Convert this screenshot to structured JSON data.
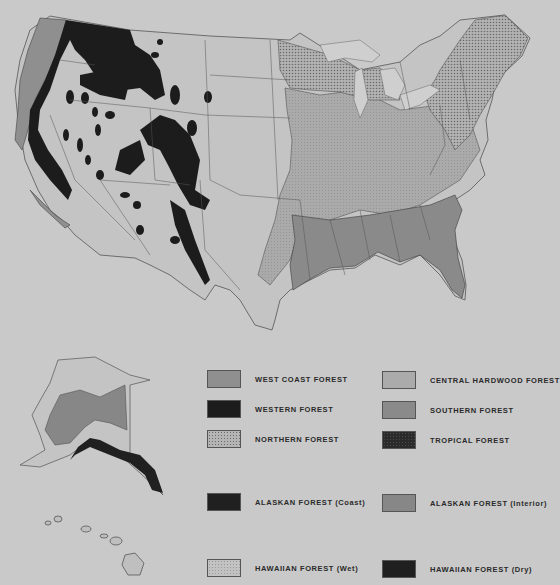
{
  "map": {
    "title": "Forest Regions of the United States",
    "regions_shown": [
      "Contiguous United States",
      "Alaska",
      "Hawaii"
    ],
    "colors": {
      "background": "#c9c9c9",
      "west_coast": "#8f8f8f",
      "western": "#1c1c1c",
      "northern": "#b5b5b5",
      "central_hardwood": "#ababab",
      "southern": "#8a8a8a",
      "tropical": "#2b2b2b",
      "alaskan_coast": "#202020",
      "alaskan_interior": "#878787",
      "hawaiian_wet": "#c2c2c2",
      "hawaiian_dry": "#1f1f1f",
      "border": "#4a4a4a"
    }
  },
  "legend": {
    "items": [
      {
        "label": "WEST COAST FOREST",
        "pattern": "medium-gray"
      },
      {
        "label": "WESTERN FOREST",
        "pattern": "black"
      },
      {
        "label": "NORTHERN FOREST",
        "pattern": "crosshatch"
      },
      {
        "label": "CENTRAL HARDWOOD FOREST",
        "pattern": "light-gray"
      },
      {
        "label": "SOUTHERN FOREST",
        "pattern": "medium-gray"
      },
      {
        "label": "TROPICAL FOREST",
        "pattern": "dark-dotted"
      },
      {
        "label": "ALASKAN FOREST (Coast)",
        "pattern": "black"
      },
      {
        "label": "ALASKAN FOREST (Interior)",
        "pattern": "medium-gray"
      },
      {
        "label": "HAWAIIAN FOREST (Wet)",
        "pattern": "light-dotted"
      },
      {
        "label": "HAWAIIAN FOREST (Dry)",
        "pattern": "black"
      }
    ]
  }
}
